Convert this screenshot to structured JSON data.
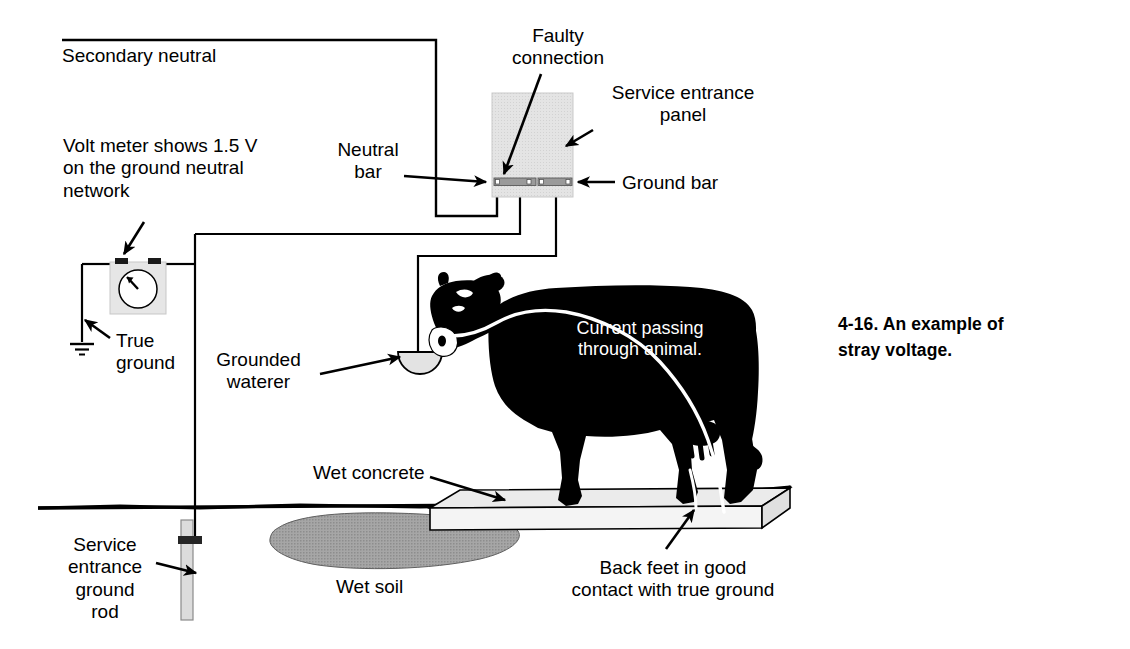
{
  "figure": {
    "caption": "4-16. An example of\nstray voltage.",
    "labels": {
      "secondary_neutral": "Secondary neutral",
      "faulty_connection": "Faulty\nconnection",
      "service_entrance_panel": "Service entrance\npanel",
      "neutral_bar": "Neutral\nbar",
      "ground_bar": "Ground bar",
      "volt_meter": "Volt meter shows 1.5 V\non the ground neutral\nnetwork",
      "true_ground": "True\nground",
      "grounded_waterer": "Grounded\nwaterer",
      "current_through_animal": "Current passing\nthrough animal.",
      "wet_concrete": "Wet concrete",
      "wet_soil": "Wet soil",
      "service_entrance_ground_rod": "Service\nentrance\nground\nrod",
      "back_feet": "Back feet in good\ncontact with true ground"
    },
    "values": {
      "voltage_reading": "1.5 V",
      "figure_number": "4-16"
    },
    "colors": {
      "ink": "#000000",
      "paper": "#ffffff",
      "panel_fill": "#e2e2e2",
      "bar_fill": "#9a9a9a",
      "soil_fill": "#9d9d9d",
      "concrete_top": "#e8e8e8",
      "concrete_side": "#f2f2f2",
      "rod_fill": "#dcdcdc",
      "current_path": "#ffffff",
      "cow_body": "#000000"
    }
  }
}
